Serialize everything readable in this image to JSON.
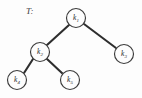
{
  "figure": {
    "caption_label": "T:",
    "background_color": "#fdfdfd",
    "ink_color": "#2e2e2e"
  },
  "diagram": {
    "type": "binary-tree",
    "node_radius": 9.5,
    "nodes": [
      {
        "id": "k1",
        "label": "k",
        "subscript": "1",
        "cx": 76,
        "cy": 18
      },
      {
        "id": "k2",
        "label": "k",
        "subscript": "2",
        "cx": 40,
        "cy": 52
      },
      {
        "id": "k3",
        "label": "k",
        "subscript": "3",
        "cx": 124,
        "cy": 54
      },
      {
        "id": "k4",
        "label": "k",
        "subscript": "4",
        "cx": 17,
        "cy": 80
      },
      {
        "id": "k5",
        "label": "k",
        "subscript": "5",
        "cx": 70,
        "cy": 80
      }
    ],
    "edges": [
      {
        "id": "e1",
        "from": "k1",
        "to": "k2",
        "x1": 69,
        "y1": 25,
        "x2": 47,
        "y2": 45
      },
      {
        "id": "e2",
        "from": "k1",
        "to": "k3",
        "x1": 84,
        "y1": 24,
        "x2": 116,
        "y2": 48
      },
      {
        "id": "e3",
        "from": "k2",
        "to": "k4",
        "x1": 33,
        "y1": 59,
        "x2": 24,
        "y2": 73
      },
      {
        "id": "e4",
        "from": "k2",
        "to": "k5",
        "x1": 47,
        "y1": 59,
        "x2": 63,
        "y2": 74
      }
    ]
  }
}
